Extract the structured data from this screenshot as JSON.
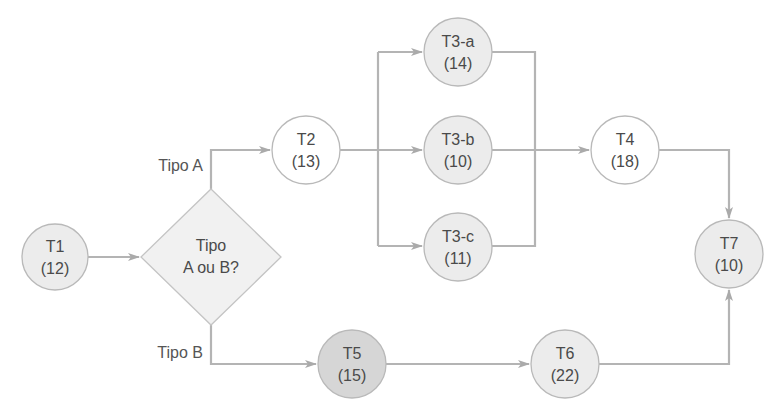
{
  "diagram": {
    "type": "flowchart",
    "colors": {
      "edge": "#b4b4b4",
      "white_fill": "#ffffff",
      "light_fill": "#ececec",
      "dark_fill": "#d6d6d6",
      "text": "#4a4a4a"
    },
    "decision": {
      "line1": "Tipo",
      "line2": "A ou B?"
    },
    "branch_labels": {
      "a": "Tipo A",
      "b": "Tipo B"
    },
    "nodes": {
      "t1": {
        "name": "T1",
        "duration": "(12)"
      },
      "t2": {
        "name": "T2",
        "duration": "(13)"
      },
      "t3a": {
        "name": "T3-a",
        "duration": "(14)"
      },
      "t3b": {
        "name": "T3-b",
        "duration": "(10)"
      },
      "t3c": {
        "name": "T3-c",
        "duration": "(11)"
      },
      "t4": {
        "name": "T4",
        "duration": "(18)"
      },
      "t5": {
        "name": "T5",
        "duration": "(15)"
      },
      "t6": {
        "name": "T6",
        "duration": "(22)"
      },
      "t7": {
        "name": "T7",
        "duration": "(10)"
      }
    },
    "edges": [
      [
        "T1",
        "Decision"
      ],
      [
        "Decision",
        "T2",
        "Tipo A"
      ],
      [
        "Decision",
        "T5",
        "Tipo B"
      ],
      [
        "T2",
        "T3-a"
      ],
      [
        "T2",
        "T3-b"
      ],
      [
        "T2",
        "T3-c"
      ],
      [
        "T3-a",
        "T4"
      ],
      [
        "T3-b",
        "T4"
      ],
      [
        "T3-c",
        "T4"
      ],
      [
        "T4",
        "T7"
      ],
      [
        "T5",
        "T6"
      ],
      [
        "T6",
        "T7"
      ]
    ]
  }
}
